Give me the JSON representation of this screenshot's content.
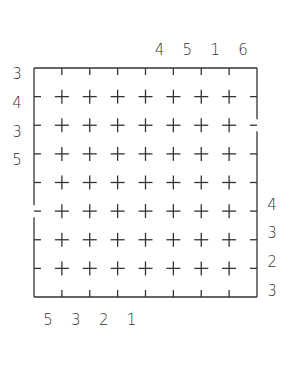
{
  "puzzle": {
    "type": "grid-puzzle",
    "rows": 8,
    "cols": 8,
    "grid": {
      "left": 34,
      "top": 68,
      "right": 257,
      "bottom": 297
    },
    "clues": {
      "top": [
        null,
        null,
        null,
        null,
        "4",
        "5",
        "1",
        "6"
      ],
      "bottom": [
        "5",
        "3",
        "2",
        "1",
        null,
        null,
        null,
        null
      ],
      "left": [
        "3",
        "4",
        "3",
        "5",
        null,
        null,
        null,
        null
      ],
      "right": [
        null,
        null,
        null,
        null,
        "4",
        "3",
        "2",
        "3"
      ]
    },
    "border_gaps": {
      "left": [
        {
          "between_rows": [
            5,
            6
          ]
        }
      ],
      "right": [
        {
          "between_rows": [
            2,
            3
          ]
        }
      ]
    },
    "line_color": "#333333"
  }
}
